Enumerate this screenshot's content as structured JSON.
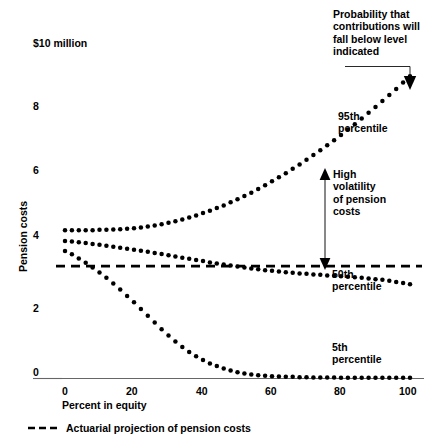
{
  "chart_data": {
    "type": "scatter",
    "title": "",
    "xlabel": "Percent in equity",
    "ylabel": "Pension costs",
    "unit_note": "$10 million",
    "xlim": [
      0,
      100
    ],
    "ylim": [
      0,
      10
    ],
    "xticks": [
      0,
      20,
      40,
      60,
      80,
      100
    ],
    "xticklabels": [
      "0",
      "20",
      "40",
      "60",
      "80",
      "100"
    ],
    "yticks": [
      0,
      2,
      4,
      6,
      8,
      10
    ],
    "yticklabels": [
      "0",
      "2",
      "4",
      "6",
      "8",
      "$10 million"
    ],
    "grid": false,
    "legend_position": "below-axis",
    "series": [
      {
        "name": "95th percentile",
        "style": "dotted",
        "x": [
          0,
          2,
          4,
          6,
          8,
          10,
          12,
          14,
          16,
          18,
          20,
          22,
          24,
          26,
          28,
          30,
          32,
          34,
          36,
          38,
          40,
          42,
          44,
          46,
          48,
          50,
          52,
          54,
          56,
          58,
          60,
          62,
          64,
          66,
          68,
          70,
          72,
          74,
          76,
          78,
          80,
          82,
          84,
          86,
          88,
          90,
          92,
          94,
          96,
          98,
          100
        ],
        "values": [
          4.42,
          4.42,
          4.42,
          4.42,
          4.42,
          4.43,
          4.43,
          4.44,
          4.45,
          4.46,
          4.48,
          4.5,
          4.53,
          4.56,
          4.6,
          4.64,
          4.69,
          4.74,
          4.8,
          4.86,
          4.93,
          5.0,
          5.08,
          5.16,
          5.25,
          5.34,
          5.44,
          5.54,
          5.65,
          5.76,
          5.88,
          6.0,
          6.12,
          6.25,
          6.38,
          6.52,
          6.66,
          6.8,
          6.95,
          7.1,
          7.26,
          7.42,
          7.58,
          7.75,
          7.92,
          8.09,
          8.27,
          8.45,
          8.63,
          8.82,
          9.01
        ]
      },
      {
        "name": "50th percentile",
        "style": "dotted",
        "x": [
          0,
          2,
          4,
          6,
          8,
          10,
          12,
          14,
          16,
          18,
          20,
          22,
          24,
          26,
          28,
          30,
          32,
          34,
          36,
          38,
          40,
          42,
          44,
          46,
          48,
          50,
          52,
          54,
          56,
          58,
          60,
          62,
          64,
          66,
          68,
          70,
          72,
          74,
          76,
          78,
          80,
          82,
          84,
          86,
          88,
          90,
          92,
          94,
          96,
          98,
          100
        ],
        "values": [
          4.1,
          4.08,
          4.06,
          4.04,
          4.01,
          3.99,
          3.96,
          3.93,
          3.9,
          3.87,
          3.84,
          3.81,
          3.78,
          3.74,
          3.71,
          3.67,
          3.64,
          3.6,
          3.57,
          3.53,
          3.5,
          3.46,
          3.43,
          3.4,
          3.37,
          3.34,
          3.31,
          3.28,
          3.26,
          3.23,
          3.21,
          3.19,
          3.17,
          3.15,
          3.13,
          3.12,
          3.1,
          3.09,
          3.07,
          3.06,
          3.05,
          3.03,
          3.02,
          3.0,
          2.98,
          2.96,
          2.94,
          2.91,
          2.88,
          2.85,
          2.81
        ]
      },
      {
        "name": "5th percentile",
        "style": "dotted",
        "x": [
          0,
          2,
          4,
          6,
          8,
          10,
          12,
          14,
          16,
          18,
          20,
          22,
          24,
          26,
          28,
          30,
          32,
          34,
          36,
          38,
          40,
          42,
          44,
          46,
          48,
          50,
          52,
          54,
          56,
          58,
          60,
          62,
          64,
          66,
          68,
          70,
          72,
          74,
          76,
          78,
          80,
          82,
          84,
          86,
          88,
          90,
          92,
          94,
          96,
          98,
          100
        ],
        "values": [
          3.8,
          3.7,
          3.58,
          3.45,
          3.31,
          3.16,
          3.0,
          2.83,
          2.65,
          2.46,
          2.27,
          2.07,
          1.87,
          1.67,
          1.47,
          1.28,
          1.1,
          0.94,
          0.79,
          0.66,
          0.55,
          0.45,
          0.37,
          0.3,
          0.24,
          0.19,
          0.15,
          0.12,
          0.1,
          0.08,
          0.07,
          0.06,
          0.05,
          0.05,
          0.04,
          0.04,
          0.03,
          0.03,
          0.03,
          0.03,
          0.02,
          0.02,
          0.02,
          0.02,
          0.02,
          0.02,
          0.02,
          0.02,
          0.02,
          0.02,
          0.02
        ]
      }
    ],
    "reference_line": {
      "name": "Actuarial projection of pension costs",
      "style": "dashed",
      "value": 3.35
    },
    "annotations": [
      {
        "name": "probability-note",
        "text": "Probability that\ncontributions will\nfall below level\nindicated",
        "x": 100,
        "y": 9.6
      },
      {
        "name": "p95-label",
        "text": "95th\npercentile",
        "x": 84,
        "y": 8.2
      },
      {
        "name": "p50-label",
        "text": "50th\npercentile",
        "x": 78,
        "y": 2.7
      },
      {
        "name": "p5-label",
        "text": "5th\npercentile",
        "x": 78,
        "y": 0.85
      },
      {
        "name": "volatility-label",
        "text": "High\nvolatility\nof pension\ncosts",
        "x": 80,
        "y": 5.9
      }
    ]
  },
  "unit_note": "$10 million",
  "y_axis": {
    "title": "Pension costs",
    "ticks": [
      {
        "label": "$10 million",
        "value": 10
      },
      {
        "label": "8",
        "value": 8
      },
      {
        "label": "6",
        "value": 6
      },
      {
        "label": "4",
        "value": 4
      },
      {
        "label": "2",
        "value": 2
      },
      {
        "label": "0",
        "value": 0
      }
    ]
  },
  "x_axis": {
    "title": "Percent in equity",
    "ticks": [
      {
        "label": "0",
        "value": 0
      },
      {
        "label": "20",
        "value": 20
      },
      {
        "label": "40",
        "value": 40
      },
      {
        "label": "60",
        "value": 60
      },
      {
        "label": "80",
        "value": 80
      },
      {
        "label": "100",
        "value": 100
      }
    ]
  },
  "annotations": {
    "probability_note": "Probability that\ncontributions will\nfall below level\nindicated",
    "p95_label": "95th\npercentile",
    "p50_label": "50th\npercentile",
    "p5_label": "5th\npercentile",
    "volatility_label": "High\nvolatility\nof pension\ncosts"
  },
  "legend": {
    "entries": [
      {
        "label": "Actuarial projection of pension costs",
        "style": "dashed"
      }
    ]
  },
  "colors": {
    "ink": "#000000",
    "axis": "#555555",
    "background": "#ffffff"
  }
}
